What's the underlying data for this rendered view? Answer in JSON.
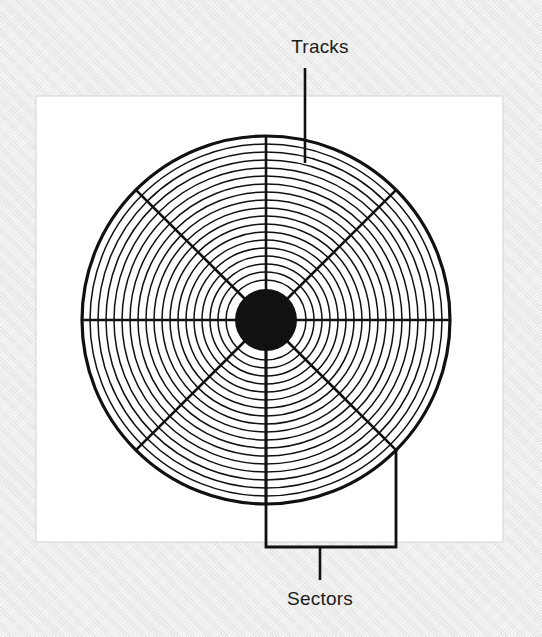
{
  "figure": {
    "title_alt": "Hard disk platter showing tracks and sectors",
    "background_color": "#e9e9e9",
    "panel_color": "#ffffff",
    "ink_color": "#111111",
    "panel": {
      "x": 36,
      "y": 96,
      "width": 467,
      "height": 446
    }
  },
  "labels": {
    "tracks": "Tracks",
    "sectors": "Sectors"
  },
  "callouts": {
    "tracks": {
      "label": "Tracks",
      "label_x": 320,
      "label_y": 53,
      "leader_x": 305,
      "leader_y_top": 68,
      "leader_y_bottom": 163
    },
    "sectors": {
      "label": "Sectors",
      "label_x": 320,
      "label_y": 605,
      "bracket_left_x": 266,
      "bracket_right_x": 396,
      "bracket_top_left_y": 320,
      "bracket_top_right_y": 450,
      "bracket_bottom_y": 547,
      "stem_x": 320,
      "stem_y_bottom": 580
    }
  },
  "chart_data": {
    "type": "diagram",
    "center": {
      "x": 266,
      "y": 320
    },
    "hub": {
      "label": "spindle-hub",
      "radius": 31,
      "fill": "#111111"
    },
    "outer_rim": {
      "radius": 184,
      "stroke_width": 3.2
    },
    "track_count": 19,
    "track_radii": [
      184,
      176,
      168,
      160,
      152,
      144,
      136,
      128,
      120,
      112,
      104,
      96,
      88,
      80,
      72,
      64,
      56,
      48,
      40
    ],
    "track_stroke_width": 1.5,
    "sector_count": 8,
    "sector_line_angles_deg": [
      0,
      45,
      90,
      135,
      180,
      225,
      270,
      315
    ],
    "sector_line_stroke_width": 2.6,
    "annotations": [
      "Tracks",
      "Sectors"
    ]
  }
}
